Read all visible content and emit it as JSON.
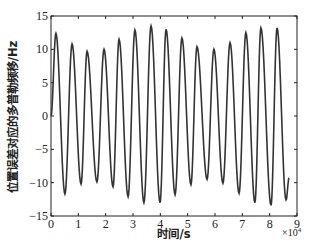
{
  "chart_data": {
    "type": "line",
    "title": "",
    "xlabel": "时间/s",
    "ylabel": "位置误差对应的多普勒频移/Hz",
    "x_multiplier": "×10",
    "x_multiplier_exp": "4",
    "xlim": [
      0,
      9
    ],
    "ylim": [
      -15,
      15
    ],
    "xticks": [
      0,
      1,
      2,
      3,
      4,
      5,
      6,
      7,
      8,
      9
    ],
    "yticks": [
      15,
      10,
      5,
      0,
      -5,
      -10,
      -15
    ],
    "xtick_labels": [
      "0",
      "1",
      "2",
      "3",
      "4",
      "5",
      "6",
      "7",
      "8",
      "9"
    ],
    "ytick_labels": [
      "15",
      "10",
      "5",
      "0",
      "-5",
      "-10",
      "-15"
    ],
    "grid": false,
    "legend": null,
    "line_color": "#333333",
    "series": [
      {
        "name": "doppler_shift",
        "x_units": "×10^4 s",
        "extrema": [
          {
            "x": 0.0,
            "y": 0.0
          },
          {
            "x": 0.18,
            "y": 12.4
          },
          {
            "x": 0.51,
            "y": -11.7
          },
          {
            "x": 0.77,
            "y": 10.8
          },
          {
            "x": 1.1,
            "y": -10.2
          },
          {
            "x": 1.32,
            "y": 9.7
          },
          {
            "x": 1.68,
            "y": -9.9
          },
          {
            "x": 1.94,
            "y": 10.0
          },
          {
            "x": 2.27,
            "y": -10.6
          },
          {
            "x": 2.49,
            "y": 11.5
          },
          {
            "x": 2.82,
            "y": -12.1
          },
          {
            "x": 3.07,
            "y": 12.9
          },
          {
            "x": 3.4,
            "y": -13.0
          },
          {
            "x": 3.66,
            "y": 13.5
          },
          {
            "x": 3.99,
            "y": -13.0
          },
          {
            "x": 4.21,
            "y": 13.0
          },
          {
            "x": 4.54,
            "y": -11.8
          },
          {
            "x": 4.79,
            "y": 11.7
          },
          {
            "x": 5.12,
            "y": -10.3
          },
          {
            "x": 5.34,
            "y": 10.4
          },
          {
            "x": 5.71,
            "y": -9.5
          },
          {
            "x": 5.96,
            "y": 10.0
          },
          {
            "x": 6.29,
            "y": -10.1
          },
          {
            "x": 6.55,
            "y": 11.0
          },
          {
            "x": 6.88,
            "y": -11.6
          },
          {
            "x": 7.13,
            "y": 12.5
          },
          {
            "x": 7.46,
            "y": -13.0
          },
          {
            "x": 7.68,
            "y": 13.2
          },
          {
            "x": 8.05,
            "y": -13.4
          },
          {
            "x": 8.27,
            "y": 13.2
          },
          {
            "x": 8.6,
            "y": -12.6
          },
          {
            "x": 8.71,
            "y": -9.3
          }
        ]
      }
    ]
  }
}
